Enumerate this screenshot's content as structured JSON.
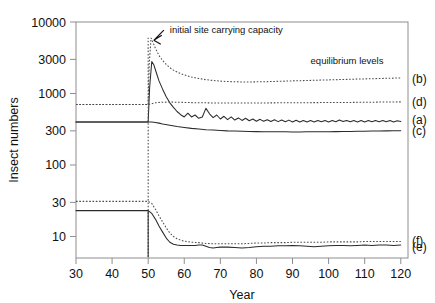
{
  "chart_data": {
    "type": "line",
    "title": "",
    "xlabel": "Year",
    "ylabel": "Insect numbers",
    "xlim": [
      30,
      122
    ],
    "ylim": [
      5,
      10000
    ],
    "yscale": "log",
    "grid": false,
    "legend_position": "right-inline",
    "xticks": [
      30,
      40,
      50,
      60,
      70,
      80,
      90,
      100,
      110,
      120
    ],
    "xticklabels": [
      "30",
      "40",
      "50",
      "60",
      "70",
      "80",
      "90",
      "100",
      "110",
      "120"
    ],
    "yticks": [
      10,
      30,
      100,
      300,
      1000,
      3000,
      10000
    ],
    "yticklabels": [
      "10",
      "30",
      "100",
      "300",
      "1000",
      "3000",
      "10000"
    ],
    "annotations": [
      {
        "name": "carrying-capacity",
        "text": "initial site carrying capacity",
        "x": 56,
        "y": 7000,
        "arrow_to_x": 51,
        "arrow_to_y": 6300
      },
      {
        "name": "equilibrium-levels",
        "text": "equilibrium levels",
        "x": 95,
        "y": 2600
      }
    ],
    "series": [
      {
        "name": "a",
        "label": "(a)",
        "style": "solid",
        "label_y": 430,
        "x": [
          30,
          34,
          38,
          42,
          46,
          49,
          50,
          50.4,
          51,
          51.6,
          52.2,
          53,
          54,
          55,
          56,
          57,
          58,
          59,
          60,
          61,
          62,
          63,
          64,
          65,
          66,
          67,
          68,
          69,
          70,
          71,
          72,
          73,
          74,
          75,
          76,
          77,
          78,
          79,
          80,
          81,
          82,
          83,
          84,
          85,
          86,
          87,
          88,
          89,
          90,
          91,
          92,
          93,
          94,
          95,
          96,
          97,
          98,
          99,
          100,
          101,
          102,
          103,
          104,
          105,
          106,
          107,
          108,
          109,
          110,
          111,
          112,
          113,
          114,
          115,
          116,
          117,
          118,
          119,
          120
        ],
        "y": [
          400,
          400,
          400,
          400,
          400,
          400,
          400,
          1200,
          2800,
          2500,
          2000,
          1500,
          1150,
          900,
          740,
          640,
          560,
          505,
          470,
          530,
          470,
          500,
          450,
          470,
          620,
          520,
          460,
          500,
          440,
          480,
          430,
          470,
          425,
          455,
          420,
          450,
          415,
          440,
          410,
          435,
          408,
          430,
          405,
          428,
          404,
          425,
          402,
          424,
          400,
          422,
          400,
          420,
          400,
          418,
          400,
          420,
          402,
          418,
          400,
          420,
          402,
          425,
          405,
          420,
          402,
          418,
          400,
          420,
          400,
          418,
          402,
          420,
          404,
          420,
          402,
          418,
          400,
          415,
          405
        ]
      },
      {
        "name": "b",
        "label": "(b)",
        "style": "dotted",
        "label_y": 1620,
        "x": [
          30,
          34,
          38,
          42,
          46,
          49,
          50,
          50.3,
          50.8,
          51.3,
          52,
          53,
          54,
          55,
          56,
          57,
          58,
          59,
          60,
          62,
          64,
          66,
          68,
          70,
          72,
          74,
          76,
          78,
          80,
          82,
          84,
          86,
          88,
          90,
          92,
          94,
          96,
          98,
          100,
          102,
          104,
          106,
          108,
          110,
          112,
          114,
          116,
          118,
          120
        ],
        "y": [
          700,
          700,
          700,
          700,
          700,
          700,
          700,
          2600,
          6000,
          5200,
          4300,
          3400,
          2900,
          2550,
          2300,
          2120,
          2000,
          1900,
          1820,
          1700,
          1620,
          1560,
          1520,
          1490,
          1470,
          1460,
          1450,
          1450,
          1455,
          1460,
          1470,
          1480,
          1490,
          1500,
          1510,
          1520,
          1530,
          1540,
          1550,
          1560,
          1570,
          1580,
          1590,
          1600,
          1610,
          1620,
          1630,
          1640,
          1650
        ]
      },
      {
        "name": "c",
        "label": "(c)",
        "style": "solid",
        "label_y": 300,
        "x": [
          30,
          34,
          38,
          42,
          46,
          49,
          50,
          51,
          52,
          53,
          54,
          56,
          58,
          60,
          62,
          64,
          66,
          68,
          70,
          72,
          74,
          76,
          78,
          80,
          82,
          84,
          86,
          88,
          90,
          92,
          94,
          96,
          98,
          100,
          102,
          104,
          106,
          108,
          110,
          112,
          114,
          116,
          118,
          120
        ],
        "y": [
          400,
          400,
          400,
          400,
          400,
          400,
          400,
          398,
          392,
          385,
          375,
          360,
          345,
          335,
          325,
          318,
          312,
          308,
          304,
          300,
          298,
          296,
          294,
          293,
          292,
          292,
          291,
          291,
          290,
          290,
          291,
          291,
          292,
          292,
          293,
          294,
          295,
          296,
          297,
          298,
          299,
          300,
          301,
          302
        ]
      },
      {
        "name": "d",
        "label": "(d)",
        "style": "dotted",
        "label_y": 760,
        "x": [
          30,
          34,
          38,
          42,
          46,
          49,
          50,
          51,
          52,
          53,
          54,
          56,
          58,
          60,
          62,
          64,
          66,
          68,
          70,
          72,
          74,
          76,
          78,
          80,
          82,
          84,
          86,
          88,
          90,
          92,
          94,
          96,
          98,
          100,
          102,
          104,
          106,
          108,
          110,
          112,
          114,
          116,
          118,
          120
        ],
        "y": [
          700,
          700,
          700,
          700,
          700,
          700,
          700,
          720,
          740,
          750,
          755,
          760,
          755,
          750,
          745,
          742,
          740,
          738,
          737,
          736,
          735,
          735,
          736,
          737,
          738,
          739,
          740,
          741,
          742,
          743,
          744,
          745,
          746,
          747,
          748,
          749,
          750,
          752,
          754,
          756,
          758,
          760,
          762,
          764
        ]
      },
      {
        "name": "e",
        "label": "(e)",
        "style": "solid",
        "label_y": 7.2,
        "x": [
          30,
          34,
          38,
          42,
          46,
          49,
          50,
          51,
          52,
          53,
          54,
          55,
          56,
          57,
          58,
          59,
          60,
          61,
          62,
          63,
          64,
          65,
          66,
          67,
          68,
          69,
          70,
          72,
          74,
          76,
          78,
          80,
          82,
          84,
          86,
          88,
          90,
          92,
          94,
          96,
          98,
          100,
          102,
          104,
          106,
          108,
          110,
          112,
          114,
          116,
          118,
          120
        ],
        "y": [
          23,
          23,
          23,
          23,
          23,
          23,
          23,
          21,
          17.5,
          14,
          11.5,
          9.5,
          8.3,
          7.8,
          7.6,
          7.5,
          7.5,
          7.5,
          7.5,
          7.5,
          7.6,
          7.6,
          7.3,
          7.0,
          6.9,
          7.0,
          7.1,
          7.1,
          7.0,
          6.9,
          7.0,
          7.2,
          7.3,
          7.3,
          7.4,
          7.4,
          7.5,
          7.4,
          7.3,
          7.2,
          7.3,
          7.4,
          7.5,
          7.5,
          7.4,
          7.5,
          7.6,
          7.5,
          7.6,
          7.6,
          7.5,
          7.6
        ]
      },
      {
        "name": "f",
        "label": "(f)",
        "style": "dotted",
        "label_y": 8.6,
        "x": [
          30,
          34,
          38,
          42,
          46,
          49,
          50,
          51,
          52,
          53,
          54,
          55,
          56,
          57,
          58,
          59,
          60,
          62,
          64,
          66,
          68,
          70,
          72,
          74,
          76,
          78,
          80,
          82,
          84,
          86,
          88,
          90,
          92,
          94,
          96,
          98,
          100,
          102,
          104,
          106,
          108,
          110,
          112,
          114,
          116,
          118,
          120
        ],
        "y": [
          31,
          31,
          31,
          31,
          31,
          31,
          31,
          29,
          24,
          19.5,
          16,
          13.2,
          11.2,
          10.0,
          9.3,
          8.9,
          8.6,
          8.3,
          8.2,
          8.0,
          7.9,
          7.9,
          7.9,
          7.9,
          7.9,
          8.0,
          8.1,
          8.1,
          8.2,
          8.2,
          8.2,
          8.3,
          8.3,
          8.3,
          8.3,
          8.3,
          8.4,
          8.4,
          8.4,
          8.4,
          8.4,
          8.5,
          8.5,
          8.5,
          8.5,
          8.5,
          8.5
        ]
      },
      {
        "name": "capacity-spike",
        "label": "",
        "style": "dotted",
        "label_y": null,
        "x": [
          50,
          50
        ],
        "y": [
          5.2,
          6000
        ]
      },
      {
        "name": "lower-crash-stem",
        "label": "",
        "style": "solid",
        "label_y": null,
        "x": [
          50,
          50
        ],
        "y": [
          5.2,
          23
        ]
      }
    ]
  }
}
